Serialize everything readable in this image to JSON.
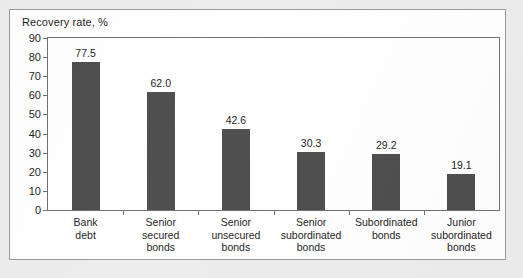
{
  "figure": {
    "title": "Recovery rate, %",
    "panel_background": "#ffffff",
    "page_background": "#ededed",
    "frame_color": "#6f6f6f",
    "bar_color": "#4d4d4d",
    "text_color": "#1d1d1d"
  },
  "chart_data": {
    "type": "bar",
    "title": "Recovery rate, %",
    "xlabel": "",
    "ylabel": "",
    "ylim": [
      0,
      90
    ],
    "ytick_step": 10,
    "yticks": [
      0,
      10,
      20,
      30,
      40,
      50,
      60,
      70,
      80,
      90
    ],
    "ytick_labels": [
      "0",
      "10",
      "20",
      "30",
      "40",
      "50",
      "60",
      "70",
      "80",
      "90"
    ],
    "grid": false,
    "legend": false,
    "categories": [
      "Bank debt",
      "Senior secured bonds",
      "Senior unsecured bonds",
      "Senior subordinated bonds",
      "Subordinated bonds",
      "Junior subordinated bonds"
    ],
    "category_lines": [
      [
        "Bank",
        "debt"
      ],
      [
        "Senior",
        "secured",
        "bonds"
      ],
      [
        "Senior",
        "unsecured",
        "bonds"
      ],
      [
        "Senior",
        "subordinated",
        "bonds"
      ],
      [
        "Subordinated",
        "bonds"
      ],
      [
        "Junior",
        "subordinated",
        "bonds"
      ]
    ],
    "values": [
      77.5,
      62.0,
      42.6,
      30.3,
      29.2,
      19.1
    ],
    "value_labels": [
      "77.5",
      "62.0",
      "42.6",
      "30.3",
      "29.2",
      "19.1"
    ]
  }
}
